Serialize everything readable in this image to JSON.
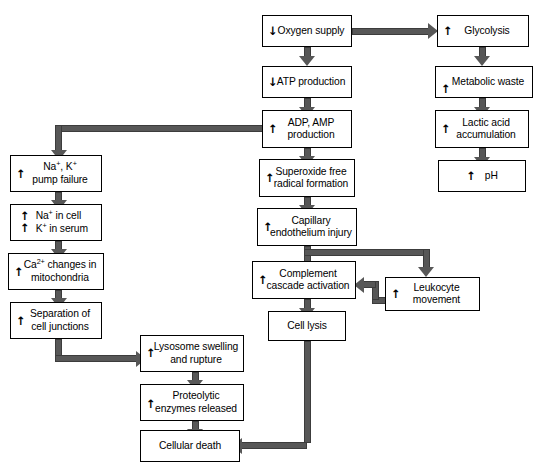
{
  "diagram": {
    "colors": {
      "box_border": "#000000",
      "box_fill": "#ffffff",
      "connector": "#575757",
      "text": "#000000"
    },
    "glyphs": {
      "up": "↑",
      "down": "↓"
    }
  },
  "nodes": [
    {
      "id": "oxygen-supply",
      "marker": "down",
      "label": "Oxygen supply",
      "line1": "Oxygen supply",
      "line2": ""
    },
    {
      "id": "atp-production",
      "marker": "down",
      "label": "ATP production",
      "line1": "ATP production",
      "line2": ""
    },
    {
      "id": "adp-amp-production",
      "marker": "up",
      "label": "ADP, AMP production",
      "line1": "ADP, AMP",
      "line2": "production"
    },
    {
      "id": "superoxide-free-radical-formation",
      "marker": "up",
      "label": "Superoxide free radical formation",
      "line1": "Superoxide free",
      "line2": "radical formation"
    },
    {
      "id": "capillary-endothelium-injury",
      "marker": "up",
      "label": "Capillary endothelium injury",
      "line1": "Capillary",
      "line2": "endothelium injury"
    },
    {
      "id": "complement-cascade-activation",
      "marker": "up",
      "label": "Complement cascade activation",
      "line1": "Complement",
      "line2": "cascade activation"
    },
    {
      "id": "cell-lysis",
      "marker": "none",
      "label": "Cell lysis",
      "line1": "Cell lysis",
      "line2": ""
    },
    {
      "id": "glycolysis",
      "marker": "up",
      "label": "Glycolysis",
      "line1": "Glycolysis",
      "line2": ""
    },
    {
      "id": "metabolic-waste",
      "marker": "up",
      "label": "Metabolic waste",
      "line1": "Metabolic waste",
      "line2": ""
    },
    {
      "id": "lactic-acid-accumulation",
      "marker": "up",
      "label": "Lactic acid accumulation",
      "line1": "Lactic acid",
      "line2": "accumulation"
    },
    {
      "id": "ph",
      "marker": "up",
      "label": "pH",
      "line1": "pH",
      "line2": ""
    },
    {
      "id": "leukocyte-movement",
      "marker": "up",
      "label": "Leukocyte movement",
      "line1": "Leukocyte",
      "line2": "movement"
    },
    {
      "id": "na-k-pump-failure",
      "marker": "up",
      "label": "Na+, K+ pump failure",
      "line1": "Na+, K+",
      "line2": "pump failure"
    },
    {
      "id": "na-in-cell-k-in-serum",
      "marker": "up",
      "label": "Na+ in cell / K+ in serum",
      "line1": "Na+ in cell",
      "line2": "K+ in serum"
    },
    {
      "id": "ca-changes-in-mitochondria",
      "marker": "up",
      "label": "Ca2+ changes in mitochondria",
      "line1": "Ca2+ changes in",
      "line2": "mitochondria"
    },
    {
      "id": "separation-of-cell-junctions",
      "marker": "up",
      "label": "Separation of cell junctions",
      "line1": "Separation of",
      "line2": "cell junctions"
    },
    {
      "id": "lysosome-swelling-and-rupture",
      "marker": "up",
      "label": "Lysosome swelling and rupture",
      "line1": "Lysosome swelling",
      "line2": "and rupture"
    },
    {
      "id": "proteolytic-enzymes-released",
      "marker": "up",
      "label": "Proteolytic enzymes released",
      "line1": "Proteolytic",
      "line2": "enzymes released"
    },
    {
      "id": "cellular-death",
      "marker": "none",
      "label": "Cellular death",
      "line1": "Cellular death",
      "line2": ""
    }
  ],
  "labels": {
    "oxygen_supply": "Oxygen supply",
    "atp_production": "ATP production",
    "adp_amp_l1": "ADP, AMP",
    "adp_amp_l2": "production",
    "superoxide_l1": "Superoxide free",
    "superoxide_l2": "radical formation",
    "capillary_l1": "Capillary",
    "capillary_l2": "endothelium injury",
    "complement_l1": "Complement",
    "complement_l2": "cascade activation",
    "cell_lysis": "Cell lysis",
    "glycolysis": "Glycolysis",
    "metabolic_waste": "Metabolic waste",
    "lactic_l1": "Lactic acid",
    "lactic_l2": "accumulation",
    "ph": "pH",
    "leukocyte_l1": "Leukocyte",
    "leukocyte_l2": "movement",
    "pump_l2": "pump failure",
    "na_in_cell": " in cell",
    "k_in_serum": " in serum",
    "ca_changes_l1": " changes in",
    "ca_changes_l2": "mitochondria",
    "separation_l1": "Separation of",
    "separation_l2": "cell junctions",
    "lysosome_l1": "Lysosome swelling",
    "lysosome_l2": "and rupture",
    "proteolytic_l1": "Proteolytic",
    "proteolytic_l2": "enzymes released",
    "cellular_death": "Cellular death",
    "na": "Na",
    "k": "K",
    "ca": "Ca",
    "sup_plus": "+",
    "sup_2plus": "2+",
    "comma_space": ", "
  },
  "edges": [
    {
      "from": "oxygen-supply",
      "to": "glycolysis",
      "kind": "horizontal-right"
    },
    {
      "from": "oxygen-supply",
      "to": "atp-production",
      "kind": "vertical-down"
    },
    {
      "from": "atp-production",
      "to": "adp-amp-production",
      "kind": "vertical-down"
    },
    {
      "from": "adp-amp-production",
      "to": "na-k-pump-failure",
      "kind": "left-then-down"
    },
    {
      "from": "adp-amp-production",
      "to": "superoxide-free-radical-formation",
      "kind": "vertical-down"
    },
    {
      "from": "superoxide-free-radical-formation",
      "to": "capillary-endothelium-injury",
      "kind": "vertical-down"
    },
    {
      "from": "capillary-endothelium-injury",
      "to": "complement-cascade-activation",
      "kind": "vertical-down"
    },
    {
      "from": "capillary-endothelium-injury",
      "to": "leukocyte-movement",
      "kind": "right-then-down"
    },
    {
      "from": "leukocyte-movement",
      "to": "complement-cascade-activation",
      "kind": "left-feedback"
    },
    {
      "from": "complement-cascade-activation",
      "to": "cell-lysis",
      "kind": "vertical-down"
    },
    {
      "from": "cell-lysis",
      "to": "cellular-death",
      "kind": "down-then-left"
    },
    {
      "from": "glycolysis",
      "to": "metabolic-waste",
      "kind": "vertical-down"
    },
    {
      "from": "metabolic-waste",
      "to": "lactic-acid-accumulation",
      "kind": "vertical-down"
    },
    {
      "from": "lactic-acid-accumulation",
      "to": "ph",
      "kind": "vertical-down"
    },
    {
      "from": "na-k-pump-failure",
      "to": "na-in-cell-k-in-serum",
      "kind": "vertical-down"
    },
    {
      "from": "na-in-cell-k-in-serum",
      "to": "ca-changes-in-mitochondria",
      "kind": "vertical-down"
    },
    {
      "from": "ca-changes-in-mitochondria",
      "to": "separation-of-cell-junctions",
      "kind": "vertical-down"
    },
    {
      "from": "separation-of-cell-junctions",
      "to": "lysosome-swelling-and-rupture",
      "kind": "down-then-right"
    },
    {
      "from": "lysosome-swelling-and-rupture",
      "to": "proteolytic-enzymes-released",
      "kind": "vertical-down"
    },
    {
      "from": "proteolytic-enzymes-released",
      "to": "cellular-death",
      "kind": "vertical-down"
    }
  ]
}
